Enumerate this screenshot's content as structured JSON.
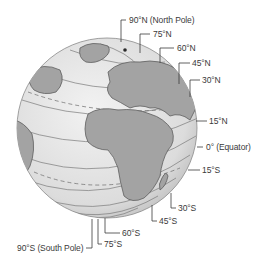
{
  "diagram": {
    "globe": {
      "cx": 107,
      "cy": 128,
      "r": 90,
      "fill": "#e4e4e4",
      "stroke": "#8a8a8a",
      "land_color": "#9a9a9a"
    },
    "labels": [
      {
        "id": "n90",
        "text": "90°N (North Pole)"
      },
      {
        "id": "n75",
        "text": "75°N"
      },
      {
        "id": "n60",
        "text": "60°N"
      },
      {
        "id": "n45",
        "text": "45°N"
      },
      {
        "id": "n30",
        "text": "30°N"
      },
      {
        "id": "n15",
        "text": "15°N"
      },
      {
        "id": "eq",
        "text": "0° (Equator)"
      },
      {
        "id": "s15",
        "text": "15°S"
      },
      {
        "id": "s30",
        "text": "30°S"
      },
      {
        "id": "s45",
        "text": "45°S"
      },
      {
        "id": "s60",
        "text": "60°S"
      },
      {
        "id": "s75",
        "text": "75°S"
      },
      {
        "id": "s90",
        "text": "90°S (South Pole)"
      }
    ]
  }
}
